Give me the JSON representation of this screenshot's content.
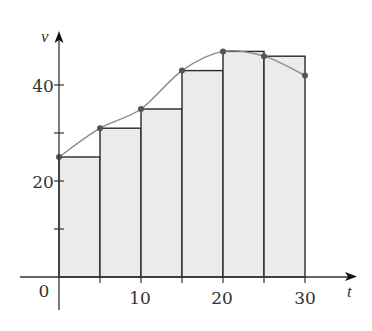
{
  "chart_data": {
    "type": "bar",
    "subtype": "left-endpoint riemann sum with curve",
    "title": "",
    "xlabel": "t",
    "ylabel": "v",
    "xlim": [
      0,
      35
    ],
    "ylim": [
      0,
      50
    ],
    "x_ticks": [
      0,
      5,
      10,
      15,
      20,
      25,
      30
    ],
    "x_tick_labels": [
      "0",
      "",
      "10",
      "",
      "20",
      "",
      "30"
    ],
    "y_ticks": [
      10,
      20,
      30,
      40
    ],
    "y_tick_labels": [
      "",
      "20",
      "",
      "40"
    ],
    "grid": false,
    "legend": null,
    "bar_width": 5,
    "categories": [
      0,
      5,
      10,
      15,
      20,
      25
    ],
    "values": [
      25,
      31,
      35,
      43,
      47,
      46
    ],
    "curve": {
      "x": [
        0,
        5,
        10,
        15,
        20,
        25,
        30
      ],
      "y": [
        25,
        31,
        35,
        43,
        47,
        46,
        42
      ]
    },
    "colors": {
      "bar_fill": "#ebebeb",
      "bar_stroke": "#2a2a2a",
      "curve": "#8a8a8a",
      "points": "#555555",
      "axis": "#333333"
    }
  },
  "labels": {
    "origin": "0",
    "x_axis": "t",
    "y_axis": "v",
    "x_tick_10": "10",
    "x_tick_20": "20",
    "x_tick_30": "30",
    "y_tick_20": "20",
    "y_tick_40": "40"
  }
}
